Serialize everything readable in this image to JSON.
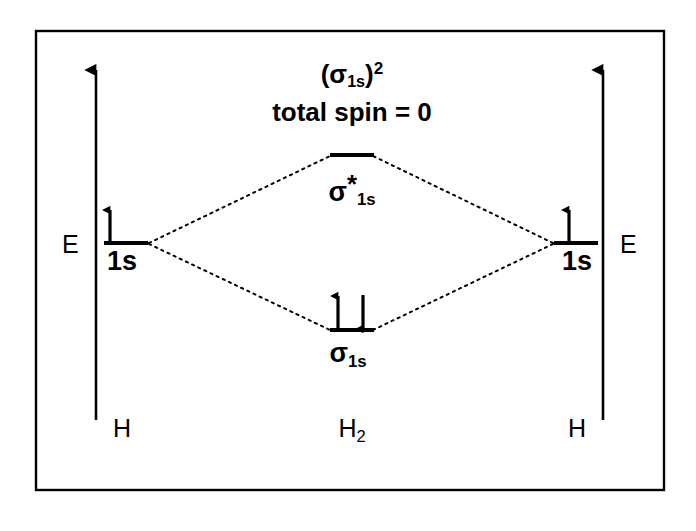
{
  "diagram": {
    "type": "molecular-orbital-diagram",
    "title_line1_prefix": "(",
    "title_line1_sigma": "σ",
    "title_line1_sub": "1s",
    "title_line1_close": ")",
    "title_line1_sup": "2",
    "title_line2": "total spin = 0",
    "axis_label_left": "E",
    "axis_label_right": "E",
    "bottom_label_left": "H",
    "bottom_label_center_main": "H",
    "bottom_label_center_sub": "2",
    "bottom_label_right": "H",
    "atomic_orbital_left_label": "1s",
    "atomic_orbital_right_label": "1s",
    "antibonding_label_sigma": "σ",
    "antibonding_label_star": "*",
    "antibonding_label_sub": "1s",
    "bonding_label_sigma": "σ",
    "bonding_label_sub": "1s",
    "colors": {
      "stroke": "#000000",
      "background": "#ffffff",
      "dotted": "#000000"
    },
    "levels": {
      "antibonding_y": 155,
      "atomic_y": 243,
      "bonding_y": 330
    },
    "electrons": {
      "left_atomic": [
        "up"
      ],
      "right_atomic": [
        "up"
      ],
      "bonding": [
        "up",
        "down"
      ],
      "antibonding": []
    },
    "counts": {
      "total_electrons": 2,
      "bond_order": 1,
      "total_spin": 0
    }
  }
}
